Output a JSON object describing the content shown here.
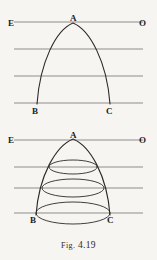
{
  "figure": {
    "caption_prefix": "Fig.",
    "caption_number": "4.19",
    "background_color": "#f7f5f1",
    "ink_color": "#2b2a28",
    "rule_color": "#8e8d8b"
  },
  "panels": [
    {
      "id": "top-panel",
      "name": "plane-section-figure",
      "description": "Parabolic arc with apex on line EO and base endpoints B and C",
      "labels": [
        {
          "text": "E",
          "x": 8,
          "y": 26
        },
        {
          "text": "A",
          "x": 71,
          "y": 22
        },
        {
          "text": "O",
          "x": 140,
          "y": 26
        },
        {
          "text": "B",
          "x": 33,
          "y": 113
        },
        {
          "text": "C",
          "x": 108,
          "y": 113
        }
      ],
      "horizontal_lines": [
        {
          "y": 22,
          "x1": 14,
          "x2": 143
        },
        {
          "y": 49,
          "x1": 14,
          "x2": 143
        },
        {
          "y": 76,
          "x1": 14,
          "x2": 143
        },
        {
          "y": 103,
          "x1": 14,
          "x2": 143
        }
      ],
      "curve": {
        "apex": {
          "x": 73,
          "y": 23
        },
        "left_end": {
          "x": 37,
          "y": 104
        },
        "right_end": {
          "x": 110,
          "y": 104
        }
      },
      "ellipses": []
    },
    {
      "id": "bottom-panel",
      "name": "solid-of-revolution-figure",
      "description": "Same arc revolved into a solid, with three elliptical cross-sections",
      "labels": [
        {
          "text": "E",
          "x": 8,
          "y": 18
        },
        {
          "text": "A",
          "x": 71,
          "y": 14
        },
        {
          "text": "O",
          "x": 140,
          "y": 18
        },
        {
          "text": "B",
          "x": 32,
          "y": 97
        },
        {
          "text": "C",
          "x": 109,
          "y": 97
        }
      ],
      "horizontal_lines": [
        {
          "y": 15,
          "x1": 14,
          "x2": 143
        },
        {
          "y": 42,
          "x1": 14,
          "x2": 143
        },
        {
          "y": 63,
          "x1": 14,
          "x2": 143
        },
        {
          "y": 88,
          "x1": 14,
          "x2": 143
        }
      ],
      "curve": {
        "apex": {
          "x": 73,
          "y": 14
        },
        "left_end": {
          "x": 37,
          "y": 90
        },
        "right_end": {
          "x": 110,
          "y": 90
        }
      },
      "ellipses": [
        {
          "cx": 73,
          "cy": 42,
          "rx": 24,
          "ry": 7
        },
        {
          "cx": 73,
          "cy": 63,
          "rx": 31,
          "ry": 9
        },
        {
          "cx": 73,
          "cy": 88,
          "rx": 37,
          "ry": 11
        }
      ]
    }
  ]
}
